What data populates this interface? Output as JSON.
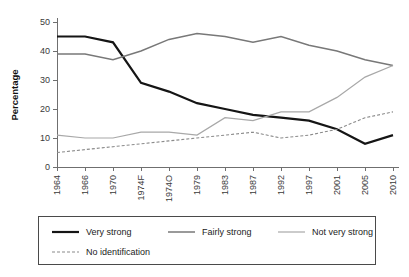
{
  "chart_data": {
    "type": "line",
    "title": "",
    "xlabel": "",
    "ylabel": "Percentage",
    "categories": [
      "1964",
      "1966",
      "1970",
      "1974F",
      "1974O",
      "1979",
      "1983",
      "1987",
      "1992",
      "1997",
      "2001",
      "2005",
      "2010"
    ],
    "yticks": [
      0,
      10,
      20,
      30,
      40,
      50
    ],
    "ylim": [
      0,
      50
    ],
    "grid": false,
    "legend_position": "bottom",
    "series": [
      {
        "name": "Very strong",
        "color": "#151515",
        "width": 2.2,
        "dash": "none",
        "values": [
          45,
          45,
          43,
          29,
          26,
          22,
          20,
          18,
          17,
          16,
          13,
          8,
          11
        ]
      },
      {
        "name": "Fairly strong",
        "color": "#787878",
        "width": 1.5,
        "dash": "none",
        "values": [
          39,
          39,
          37,
          40,
          44,
          46,
          45,
          43,
          45,
          42,
          40,
          37,
          35
        ]
      },
      {
        "name": "Not very strong",
        "color": "#a8a8a8",
        "width": 1.2,
        "dash": "none",
        "values": [
          11,
          10,
          10,
          12,
          12,
          11,
          17,
          16,
          19,
          19,
          24,
          31,
          35
        ]
      },
      {
        "name": "No identification",
        "color": "#8a8a8a",
        "width": 1.1,
        "dash": "3,2",
        "values": [
          5,
          6,
          7,
          8,
          9,
          10,
          11,
          12,
          10,
          11,
          13,
          17,
          19
        ]
      }
    ]
  },
  "legend": {
    "entries": [
      {
        "label": "Very strong"
      },
      {
        "label": "Fairly strong"
      },
      {
        "label": "Not very strong"
      },
      {
        "label": "No identification"
      }
    ]
  }
}
